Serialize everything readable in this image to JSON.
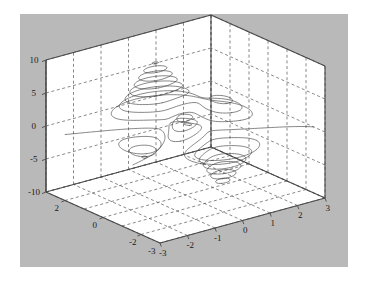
{
  "figure": {
    "type": "matlab-figure",
    "background_color": "#b9b9b9",
    "axes_background_color": "#ffffff",
    "page_color": "#ffffff",
    "grid_color": "#555555",
    "contour_color": "#3a3a3a",
    "axis_line_color": "#4a4a4a",
    "tick_text_color": "#1a1a1a"
  },
  "chart_data": {
    "type": "line",
    "plot_kind": "contour3",
    "title": "",
    "subtitle": "",
    "xlabel": "",
    "ylabel": "",
    "zlabel": "",
    "grid": true,
    "legend": "none",
    "projection": "3d-orthographic",
    "view": {
      "azimuth": -37.5,
      "elevation": 30
    },
    "function": "peaks",
    "surface_expression": "3*(1-x)^2*exp(-x^2-(y+1)^2) - 10*(x/5 - x^3 - y^5)*exp(-x^2-y^2) - (1/3)*exp(-(x+1)^2 - y^2)",
    "xlim": [
      -3,
      3
    ],
    "ylim": [
      -3,
      3
    ],
    "zlim": [
      -10,
      10
    ],
    "xticks": [
      -3,
      -2,
      -1,
      0,
      1,
      2,
      3
    ],
    "xtick_labels": [
      "-3",
      "-2",
      "-1",
      "0",
      "1",
      "2",
      "3"
    ],
    "yticks": [
      -3,
      -2,
      0,
      2
    ],
    "ytick_labels": [
      "-3",
      "-2",
      "0",
      "2"
    ],
    "zticks": [
      -10,
      -5,
      0,
      5,
      10
    ],
    "ztick_labels": [
      "-10",
      "-5",
      "0",
      "5",
      "10"
    ],
    "contour_levels": [
      -7,
      -6,
      -5,
      -4,
      -3,
      -2,
      -1,
      0,
      1,
      2,
      3,
      4,
      5,
      6,
      7,
      8
    ],
    "n_contour_levels": 16,
    "features": [
      {
        "name": "global-maximum-peak",
        "x": -0.01,
        "y": 1.58,
        "z": 8.11
      },
      {
        "name": "global-minimum-valley",
        "x": 0.23,
        "y": -1.63,
        "z": -6.55
      },
      {
        "name": "secondary-maximum",
        "x": -1.35,
        "y": 0.2,
        "z": 3.78
      },
      {
        "name": "secondary-minimum",
        "x": -0.46,
        "y": -0.63,
        "z": -3.05
      }
    ]
  },
  "ticks": {
    "z": [
      {
        "label": "10",
        "value": 10
      },
      {
        "label": "5",
        "value": 5
      },
      {
        "label": "0",
        "value": 0
      },
      {
        "label": "-5",
        "value": -5
      },
      {
        "label": "-10",
        "value": -10
      }
    ],
    "y": [
      {
        "label": "2",
        "value": 2
      },
      {
        "label": "0",
        "value": 0
      },
      {
        "label": "-2",
        "value": -2
      },
      {
        "label": "-3",
        "value": -3
      }
    ],
    "x": [
      {
        "label": "-3",
        "value": -3
      },
      {
        "label": "-2",
        "value": -2
      },
      {
        "label": "-1",
        "value": -1
      },
      {
        "label": "0",
        "value": 0
      },
      {
        "label": "1",
        "value": 1
      },
      {
        "label": "2",
        "value": 2
      },
      {
        "label": "3",
        "value": 3
      }
    ]
  }
}
